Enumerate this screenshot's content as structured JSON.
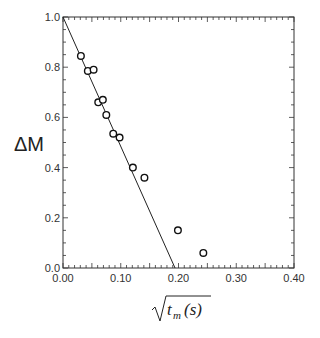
{
  "chart_data": {
    "type": "scatter",
    "title": "",
    "xlabel_parts": {
      "var": "t",
      "sub": "m",
      "unit": "(s)",
      "radical": true
    },
    "xlabel": "sqrt(t_m(s))",
    "ylabel": "ΔM",
    "xlim": [
      0.0,
      0.4
    ],
    "ylim": [
      0.0,
      1.0
    ],
    "xticks": [
      0.0,
      0.1,
      0.2,
      0.3,
      0.4
    ],
    "xtick_labels": [
      "0.00",
      "0.10",
      "0.20",
      "0.30",
      "0.40"
    ],
    "yticks": [
      0.0,
      0.2,
      0.4,
      0.6,
      0.8,
      1.0
    ],
    "ytick_labels": [
      "0.0",
      "0.2",
      "0.4",
      "0.6",
      "0.8",
      "1.0"
    ],
    "grid": false,
    "legend": "none",
    "series": [
      {
        "name": "data",
        "marker": "open-circle",
        "points": [
          [
            0.031,
            0.845
          ],
          [
            0.043,
            0.785
          ],
          [
            0.053,
            0.79
          ],
          [
            0.061,
            0.66
          ],
          [
            0.069,
            0.67
          ],
          [
            0.075,
            0.61
          ],
          [
            0.087,
            0.535
          ],
          [
            0.098,
            0.52
          ],
          [
            0.121,
            0.4
          ],
          [
            0.141,
            0.36
          ],
          [
            0.199,
            0.15
          ],
          [
            0.243,
            0.06
          ]
        ]
      },
      {
        "name": "linear fit",
        "type": "line",
        "points": [
          [
            0.0,
            1.0
          ],
          [
            0.194,
            0.0
          ]
        ]
      }
    ]
  }
}
